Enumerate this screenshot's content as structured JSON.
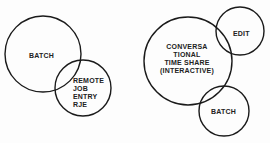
{
  "diagrams": [
    {
      "circles": [
        {
          "name": "batch",
          "label": "BATCH"
        },
        {
          "name": "rje",
          "label": "REMOTE\nJOB\nENTRY\nRJE"
        }
      ]
    },
    {
      "circles": [
        {
          "name": "timeshare",
          "label": "CONVERSA\nTIONAL\nTIME SHARE\n(INTERACTIVE)"
        },
        {
          "name": "edit",
          "label": "EDIT"
        },
        {
          "name": "batch",
          "label": "BATCH"
        }
      ]
    }
  ],
  "colors": {
    "stroke": "#1a1a1a",
    "text": "#222222",
    "background": "#fdfdfd"
  }
}
